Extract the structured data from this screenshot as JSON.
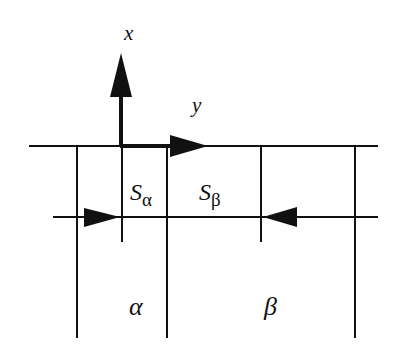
{
  "diagram": {
    "axes": {
      "x_label": "x",
      "y_label": "y"
    },
    "regions": {
      "S_alpha": {
        "main": "S",
        "sub": "α"
      },
      "S_beta": {
        "main": "S",
        "sub": "β"
      },
      "phase_alpha": "α",
      "phase_beta": "β"
    },
    "colors": {
      "line": "#111111",
      "background": "#ffffff"
    }
  }
}
